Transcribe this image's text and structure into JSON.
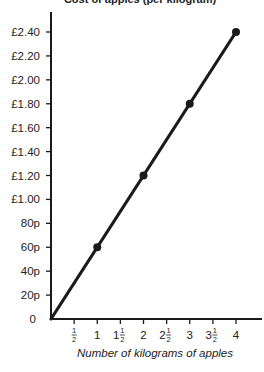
{
  "chart_data": {
    "type": "line",
    "title": "Cost of apples (per kilogram)",
    "title_clipped": true,
    "xlabel": "Number of kilograms of apples",
    "ylabel": "",
    "x": [
      1,
      2,
      3,
      4
    ],
    "series": [
      {
        "name": "Cost",
        "values": [
          0.6,
          1.2,
          1.8,
          2.4
        ],
        "line_from_origin": true,
        "markers": true
      }
    ],
    "xlim": [
      0,
      4
    ],
    "ylim": [
      0,
      2.4
    ],
    "x_ticks": [
      0.5,
      1,
      1.5,
      2,
      2.5,
      3,
      3.5,
      4
    ],
    "x_tick_labels": [
      {
        "whole": "",
        "frac": true
      },
      {
        "whole": "1",
        "frac": false
      },
      {
        "whole": "1",
        "frac": true
      },
      {
        "whole": "2",
        "frac": false
      },
      {
        "whole": "2",
        "frac": true
      },
      {
        "whole": "3",
        "frac": false
      },
      {
        "whole": "3",
        "frac": true
      },
      {
        "whole": "4",
        "frac": false
      }
    ],
    "y_ticks": [
      0,
      0.2,
      0.4,
      0.6,
      0.8,
      1.0,
      1.2,
      1.4,
      1.6,
      1.8,
      2.0,
      2.2,
      2.4
    ],
    "y_tick_labels": [
      "0",
      "20p",
      "40p",
      "60p",
      "80p",
      "£1.00",
      "£1.20",
      "£1.40",
      "£1.60",
      "£1.80",
      "£2.00",
      "£2.20",
      "£2.40"
    ],
    "grid": false,
    "legend": null,
    "colors": {
      "line": "#1a1a1a",
      "axis": "#1a1a1a",
      "text": "#222222"
    }
  }
}
